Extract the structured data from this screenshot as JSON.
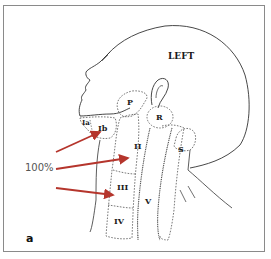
{
  "figure": {
    "panel_label": "a",
    "side_label": "LEFT",
    "percentage_label": "100%",
    "arrow_color": "#b5352c",
    "regions": {
      "ia": "Ia",
      "ib": "Ib",
      "ii": "II",
      "iii": "III",
      "iv": "IV",
      "v": "V",
      "p": "P",
      "r": "R",
      "s": "S"
    }
  }
}
